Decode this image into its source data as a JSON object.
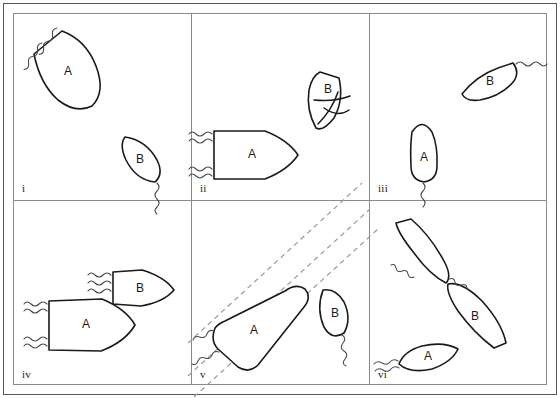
{
  "figure": {
    "background": "#ffffff",
    "ink_color": "#1a1a1a",
    "wake_color": "#4a4a4a",
    "channel_color": "#9a9a9a",
    "frame_color": "#555555",
    "grid_color": "#8a8a8a",
    "columns": 3,
    "rows": 2
  },
  "panels": [
    {
      "id": "i",
      "numeral": "i",
      "boats": [
        {
          "label": "A",
          "name": "boat-a",
          "heading": "down-right",
          "hull": "blunt-stern-pointed-bow",
          "wakes": 2,
          "wake_side": "upper-left"
        },
        {
          "label": "B",
          "name": "boat-b",
          "heading": "down-right",
          "hull": "pointed-oval",
          "wakes": 1,
          "wake_side": "lower-right"
        }
      ],
      "channel_lines": 0
    },
    {
      "id": "ii",
      "numeral": "ii",
      "boats": [
        {
          "label": "A",
          "name": "boat-a",
          "heading": "right",
          "hull": "blunt-stern-pointed-bow",
          "wakes": 2,
          "wake_side": "left"
        },
        {
          "label": "B",
          "name": "boat-b",
          "heading": "down-left",
          "hull": "pointed-oval",
          "wakes": 0,
          "wake_side": "none",
          "overlay": "crossed-curves"
        }
      ],
      "channel_lines": 0
    },
    {
      "id": "iii",
      "numeral": "iii",
      "boats": [
        {
          "label": "A",
          "name": "boat-a",
          "heading": "up",
          "hull": "rounded-bow",
          "wakes": 1,
          "wake_side": "below"
        },
        {
          "label": "B",
          "name": "boat-b",
          "heading": "up-left",
          "hull": "pointed-oval",
          "wakes": 1,
          "wake_side": "upper-right"
        }
      ],
      "channel_lines": 0
    },
    {
      "id": "iv",
      "numeral": "iv",
      "boats": [
        {
          "label": "A",
          "name": "boat-a",
          "heading": "right",
          "hull": "blunt-stern-pointed-bow",
          "wakes": 2,
          "wake_side": "left"
        },
        {
          "label": "B",
          "name": "boat-b",
          "heading": "right",
          "hull": "pointed-oval",
          "wakes": 1,
          "wake_side": "left"
        }
      ],
      "channel_lines": 0
    },
    {
      "id": "v",
      "numeral": "v",
      "boats": [
        {
          "label": "A",
          "name": "boat-a",
          "heading": "up-right",
          "hull": "long-rounded",
          "wakes": 2,
          "wake_side": "lower-left"
        },
        {
          "label": "B",
          "name": "boat-b",
          "heading": "up-left",
          "hull": "pointed-oval",
          "wakes": 1,
          "wake_side": "lower-right"
        }
      ],
      "channel_lines": 3
    },
    {
      "id": "vi",
      "numeral": "vi",
      "boats": [
        {
          "label": "",
          "name": "boat-unlabeled",
          "heading": "up-left",
          "hull": "pointed-oval",
          "wakes": 1,
          "wake_side": "lower-right"
        },
        {
          "label": "B",
          "name": "boat-b",
          "heading": "down-right",
          "hull": "pointed-oval",
          "wakes": 1,
          "wake_side": "upper-left"
        },
        {
          "label": "A",
          "name": "boat-a",
          "heading": "up-right",
          "hull": "pointed-oval",
          "wakes": 1,
          "wake_side": "lower-left"
        }
      ],
      "channel_lines": 0
    }
  ],
  "labels": {
    "boat_a": "A",
    "boat_b": "B"
  }
}
